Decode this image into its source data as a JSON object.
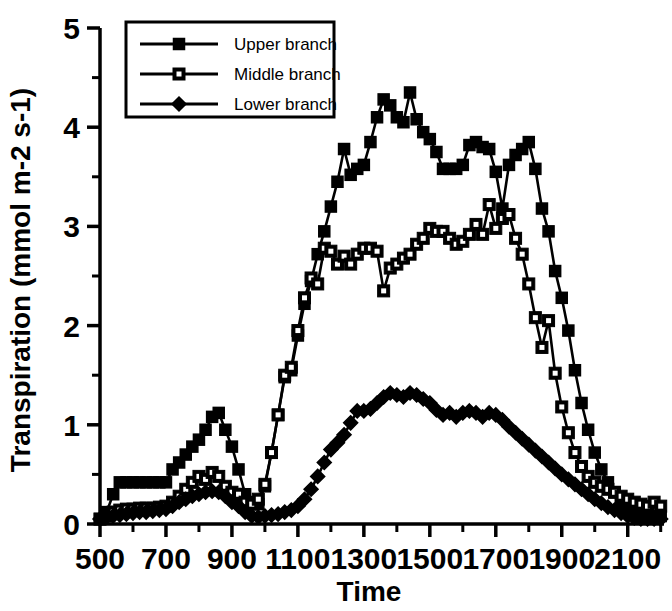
{
  "chart_data": {
    "type": "line",
    "title": "",
    "xlabel": "Time",
    "ylabel": "Transpiration  (mmol  m-2  s-1)",
    "xlim": [
      500,
      2210
    ],
    "ylim": [
      0,
      5
    ],
    "xticks": [
      500,
      700,
      900,
      1100,
      1300,
      1500,
      1700,
      1900,
      2100
    ],
    "xtick_labels": [
      "500",
      "700",
      "900",
      "1100",
      "1300",
      "1500",
      "1700",
      "1900",
      "2100"
    ],
    "xminor_step": 100,
    "yticks": [
      0,
      1,
      2,
      3,
      4,
      5
    ],
    "ytick_labels": [
      "0",
      "1",
      "2",
      "3",
      "4",
      "5"
    ],
    "yminor_step": 0.5,
    "grid": false,
    "legend_position": "upper-left",
    "x": [
      500,
      520,
      540,
      560,
      580,
      600,
      620,
      640,
      660,
      680,
      700,
      720,
      740,
      760,
      780,
      800,
      820,
      840,
      860,
      880,
      900,
      920,
      940,
      960,
      980,
      1000,
      1020,
      1040,
      1060,
      1080,
      1100,
      1120,
      1140,
      1160,
      1180,
      1200,
      1220,
      1240,
      1260,
      1280,
      1300,
      1320,
      1340,
      1360,
      1380,
      1400,
      1420,
      1440,
      1460,
      1480,
      1500,
      1520,
      1540,
      1560,
      1580,
      1600,
      1620,
      1640,
      1660,
      1680,
      1700,
      1720,
      1740,
      1760,
      1780,
      1800,
      1820,
      1840,
      1860,
      1880,
      1900,
      1920,
      1940,
      1960,
      1980,
      2000,
      2020,
      2040,
      2060,
      2080,
      2100,
      2120,
      2140,
      2160,
      2180,
      2200
    ],
    "series": [
      {
        "name": "Upper branch",
        "marker": "filled-square",
        "values": [
          0.05,
          0.12,
          0.3,
          0.42,
          0.42,
          0.42,
          0.42,
          0.42,
          0.42,
          0.42,
          0.42,
          0.55,
          0.62,
          0.7,
          0.78,
          0.85,
          0.95,
          1.08,
          1.12,
          0.95,
          0.78,
          0.55,
          0.3,
          0.22,
          0.2,
          0.38,
          0.72,
          1.1,
          1.48,
          1.55,
          1.9,
          2.22,
          2.45,
          2.72,
          2.95,
          3.2,
          3.45,
          3.78,
          3.52,
          3.58,
          3.62,
          3.85,
          4.1,
          4.28,
          4.22,
          4.1,
          4.05,
          4.35,
          4.08,
          3.95,
          3.88,
          3.75,
          3.58,
          3.58,
          3.58,
          3.62,
          3.82,
          3.85,
          3.8,
          3.78,
          3.55,
          3.18,
          3.62,
          3.72,
          3.78,
          3.85,
          3.58,
          3.18,
          2.95,
          2.55,
          2.28,
          1.95,
          1.55,
          1.22,
          0.95,
          0.72,
          0.55,
          0.42,
          0.32,
          0.22,
          0.15,
          0.12,
          0.1,
          0.08,
          0.08,
          0.08
        ]
      },
      {
        "name": "Middle branch",
        "marker": "open-square",
        "values": [
          0.05,
          0.08,
          0.12,
          0.14,
          0.15,
          0.15,
          0.16,
          0.16,
          0.16,
          0.17,
          0.18,
          0.22,
          0.28,
          0.35,
          0.42,
          0.48,
          0.45,
          0.52,
          0.48,
          0.38,
          0.32,
          0.3,
          0.22,
          0.2,
          0.25,
          0.4,
          0.72,
          1.1,
          1.5,
          1.58,
          1.95,
          2.28,
          2.48,
          2.42,
          2.78,
          2.75,
          2.62,
          2.7,
          2.62,
          2.72,
          2.78,
          2.78,
          2.75,
          2.35,
          2.58,
          2.62,
          2.68,
          2.72,
          2.82,
          2.88,
          2.98,
          2.95,
          2.95,
          2.88,
          2.82,
          2.85,
          2.92,
          3.02,
          2.92,
          3.22,
          2.98,
          3.08,
          3.12,
          2.88,
          2.72,
          2.42,
          2.08,
          1.78,
          2.05,
          1.52,
          1.18,
          0.92,
          0.72,
          0.58,
          0.48,
          0.42,
          0.38,
          0.35,
          0.32,
          0.28,
          0.25,
          0.22,
          0.2,
          0.18,
          0.22,
          0.18
        ]
      },
      {
        "name": "Lower branch",
        "marker": "filled-diamond",
        "values": [
          0.05,
          0.07,
          0.08,
          0.09,
          0.1,
          0.11,
          0.12,
          0.12,
          0.13,
          0.14,
          0.15,
          0.18,
          0.22,
          0.25,
          0.28,
          0.3,
          0.32,
          0.33,
          0.32,
          0.28,
          0.22,
          0.18,
          0.12,
          0.08,
          0.07,
          0.08,
          0.09,
          0.1,
          0.12,
          0.14,
          0.18,
          0.25,
          0.35,
          0.48,
          0.62,
          0.75,
          0.82,
          0.9,
          1.02,
          1.14,
          1.14,
          1.16,
          1.22,
          1.28,
          1.32,
          1.3,
          1.28,
          1.32,
          1.3,
          1.26,
          1.22,
          1.15,
          1.1,
          1.12,
          1.08,
          1.12,
          1.14,
          1.12,
          1.08,
          1.12,
          1.1,
          1.05,
          0.98,
          0.92,
          0.86,
          0.8,
          0.74,
          0.68,
          0.62,
          0.56,
          0.5,
          0.45,
          0.4,
          0.35,
          0.3,
          0.25,
          0.21,
          0.17,
          0.14,
          0.11,
          0.08,
          0.06,
          0.05,
          0.05,
          0.05,
          0.05
        ]
      }
    ]
  },
  "axes": {
    "xlabel": "Time",
    "ylabel": "Transpiration  (mmol  m-2  s-1)"
  },
  "legend": {
    "items": [
      {
        "label": "Upper branch",
        "marker": "filled-square"
      },
      {
        "label": "Middle branch",
        "marker": "open-square"
      },
      {
        "label": "Lower branch",
        "marker": "filled-diamond"
      }
    ]
  },
  "colors": {
    "ink": "#000000",
    "background": "#ffffff"
  }
}
